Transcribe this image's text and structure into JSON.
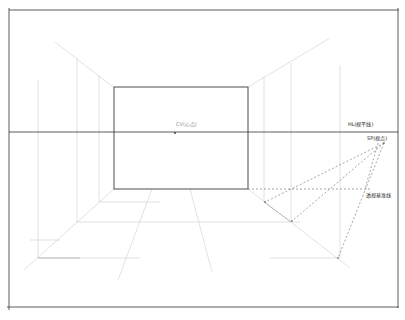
{
  "drawing": {
    "title": "One-point perspective interior",
    "labels": {
      "cv": "CV(心点)",
      "hl": "HL(视平线)",
      "sp": "SP(视点)",
      "base": "透视基准线"
    },
    "colors": {
      "ink": "#3a3a3a",
      "frame": "#4a4a4a",
      "construction": "#c8c8c8",
      "dashed": "#6a6a6a",
      "paper": "#ffffff"
    }
  }
}
